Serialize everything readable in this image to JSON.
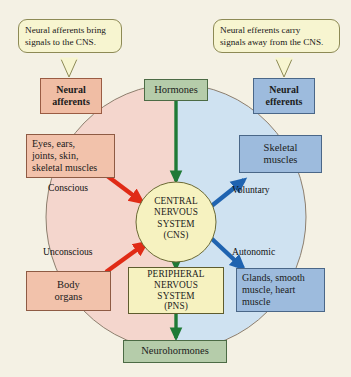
{
  "diagram": {
    "background_color": "#f4f1e4",
    "callouts": [
      {
        "id": "callout-afferent",
        "line1": "Neural afferents bring",
        "line2": "signals to the CNS."
      },
      {
        "id": "callout-efferent",
        "line1": "Neural efferents carry",
        "line2": "signals away from the CNS."
      }
    ],
    "boxes": {
      "neural_afferents": {
        "line1": "Neural",
        "line2": "afferents",
        "color": "#f0bda4"
      },
      "neural_efferents": {
        "line1": "Neural",
        "line2": "efferents",
        "color": "#9dbbdd"
      },
      "hormones": {
        "line1": "Hormones",
        "color": "#b5ccaa"
      },
      "neurohormones": {
        "line1": "Neurohormones",
        "color": "#b5ccaa"
      },
      "sensory_receptors": {
        "line1": "Eyes, ears,",
        "line2": "joints, skin,",
        "line3": "skeletal muscles",
        "color": "#f2c2ab"
      },
      "body_organs": {
        "line1": "Body",
        "line2": "organs",
        "color": "#f2c2ab"
      },
      "skeletal_muscles": {
        "line1": "Skeletal",
        "line2": "muscles",
        "color": "#9dbbdd"
      },
      "glands": {
        "line1": "Glands, smooth",
        "line2": "muscle, heart",
        "line3": "muscle",
        "color": "#9dbbdd"
      },
      "cns": {
        "line1": "CENTRAL",
        "line2": "NERVOUS",
        "line3": "SYSTEM",
        "line4": "(CNS)",
        "color": "#f6f2c0"
      },
      "pns": {
        "line1": "PERIPHERAL",
        "line2": "NERVOUS",
        "line3": "SYSTEM",
        "line4": "(PNS)",
        "color": "#f6f2c0"
      }
    },
    "pathway_labels": {
      "conscious": "Conscious",
      "unconscious": "Unconscious",
      "voluntary": "Voluntary",
      "autonomic": "Autonomic"
    },
    "oval": {
      "left_half_color": "#f4d6cd",
      "right_half_color": "#cfe2f1",
      "outline_color": "#8d7f6e"
    },
    "arrows": [
      {
        "id": "arrow-hormones-to-cns",
        "color": "#1f7a36",
        "direction": "down",
        "from": "hormones",
        "to": "cns"
      },
      {
        "id": "arrow-cns-to-pns",
        "color": "#1f7a36",
        "direction": "down",
        "from": "cns",
        "to": "pns"
      },
      {
        "id": "arrow-pns-to-neurohormones",
        "color": "#1f7a36",
        "direction": "down",
        "from": "pns",
        "to": "neurohormones"
      },
      {
        "id": "arrow-sensory-to-cns",
        "color": "#e02b16",
        "direction": "down-right",
        "from": "sensory_receptors",
        "to": "cns",
        "label": "Conscious"
      },
      {
        "id": "arrow-body-organs-to-cns",
        "color": "#e02b16",
        "direction": "up-right",
        "from": "body_organs",
        "to": "cns",
        "label": "Unconscious"
      },
      {
        "id": "arrow-cns-to-skeletal",
        "color": "#1f63b0",
        "direction": "up-right",
        "from": "cns",
        "to": "skeletal_muscles",
        "label": "Voluntary"
      },
      {
        "id": "arrow-cns-to-glands",
        "color": "#1f63b0",
        "direction": "down-right",
        "from": "cns",
        "to": "glands",
        "label": "Autonomic"
      }
    ]
  }
}
